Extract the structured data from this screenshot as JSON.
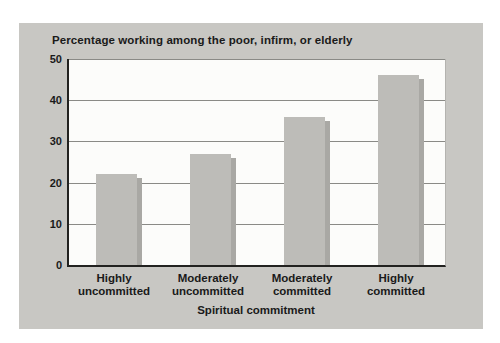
{
  "colors": {
    "page_background": "#ffffff",
    "panel_background": "#c8c7c3",
    "plot_background": "#fcfcfa",
    "bar": "#bdbcb8",
    "bar_shadow": "#a9a8a4",
    "gridline": "#8a8a86",
    "axis": "#222220",
    "text": "#1a1a1a"
  },
  "chart_data": {
    "type": "bar",
    "title": "Percentage working among the poor, infirm, or elderly",
    "xlabel": "Spiritual commitment",
    "ylabel": "",
    "categories": [
      "Highly\nuncommitted",
      "Moderately\nuncommitted",
      "Moderately\ncommitted",
      "Highly\ncommitted"
    ],
    "values": [
      22,
      27,
      36,
      46
    ],
    "ylim": [
      0,
      50
    ],
    "yticks": [
      0,
      10,
      20,
      30,
      40,
      50
    ],
    "grid": true,
    "legend_position": "none"
  }
}
